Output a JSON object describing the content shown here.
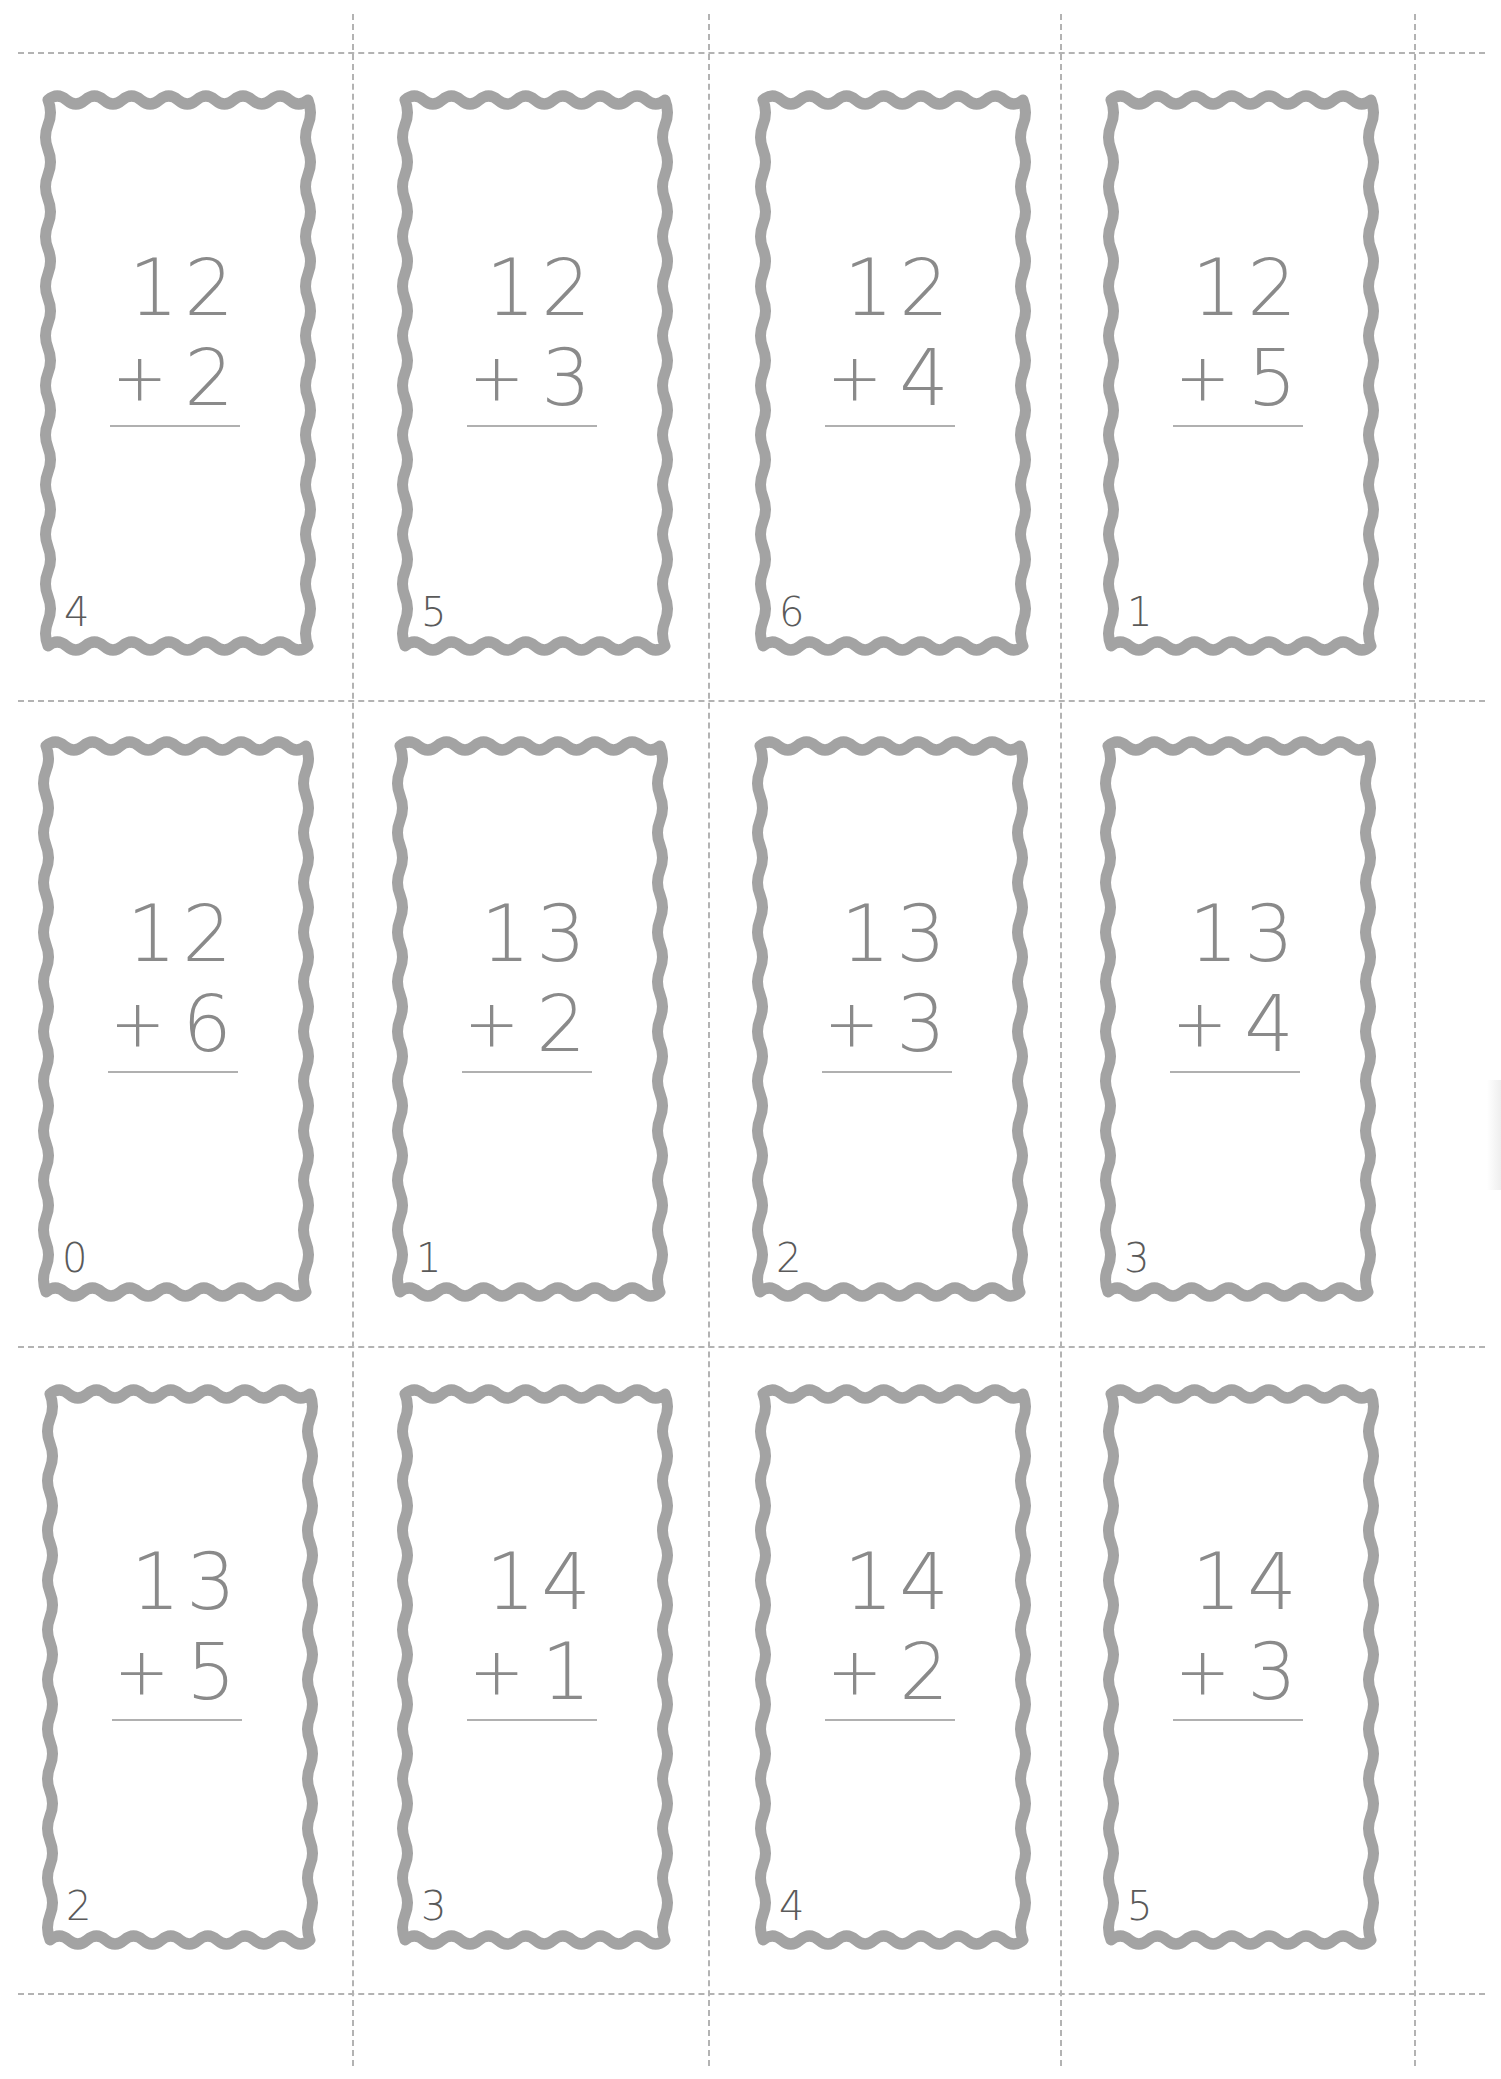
{
  "sheet": {
    "title": "",
    "rows": 3,
    "columns": 4,
    "colors": {
      "card_border": "#a3a3a3",
      "problem_text": "#8a8a8a",
      "corner_number": "#5a5a5a",
      "cut_lines": "#b3b3b3",
      "background": "#ffffff"
    }
  },
  "cards": [
    {
      "top": "12",
      "bottom": "2",
      "op": "+",
      "corner": "4"
    },
    {
      "top": "12",
      "bottom": "3",
      "op": "+",
      "corner": "5"
    },
    {
      "top": "12",
      "bottom": "4",
      "op": "+",
      "corner": "6"
    },
    {
      "top": "12",
      "bottom": "5",
      "op": "+",
      "corner": "1"
    },
    {
      "top": "12",
      "bottom": "6",
      "op": "+",
      "corner": "0"
    },
    {
      "top": "13",
      "bottom": "2",
      "op": "+",
      "corner": "1"
    },
    {
      "top": "13",
      "bottom": "3",
      "op": "+",
      "corner": "2"
    },
    {
      "top": "13",
      "bottom": "4",
      "op": "+",
      "corner": "3"
    },
    {
      "top": "13",
      "bottom": "5",
      "op": "+",
      "corner": "2"
    },
    {
      "top": "14",
      "bottom": "1",
      "op": "+",
      "corner": "3"
    },
    {
      "top": "14",
      "bottom": "2",
      "op": "+",
      "corner": "4"
    },
    {
      "top": "14",
      "bottom": "3",
      "op": "+",
      "corner": "5"
    }
  ]
}
